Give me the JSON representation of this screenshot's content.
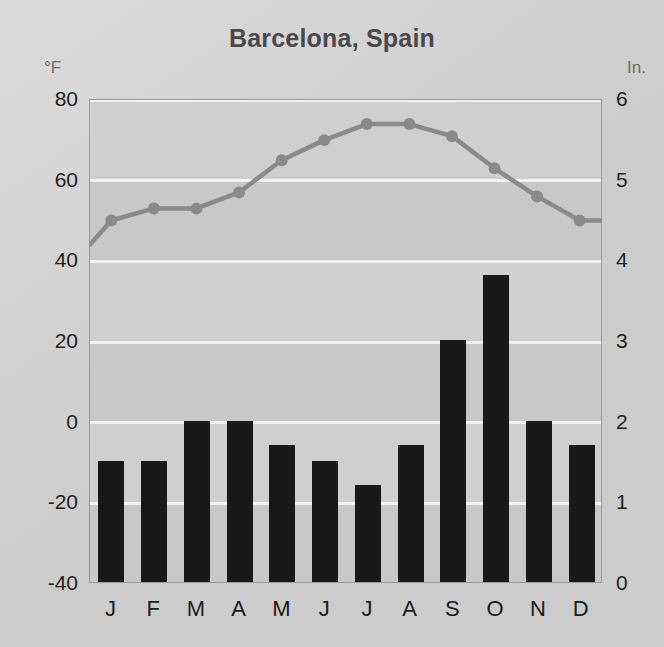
{
  "chart_data": {
    "type": "bar",
    "title": "Barcelona, Spain",
    "xlabel": "",
    "ylabel": "°F",
    "y2label": "In.",
    "categories": [
      "J",
      "F",
      "M",
      "A",
      "M",
      "J",
      "J",
      "A",
      "S",
      "O",
      "N",
      "D"
    ],
    "month_names": [
      "January",
      "February",
      "March",
      "April",
      "May",
      "June",
      "July",
      "August",
      "September",
      "October",
      "November",
      "December"
    ],
    "series": [
      {
        "name": "Precipitation",
        "unit": "In.",
        "render": "bar",
        "color": "#181818",
        "axis": "right",
        "values": [
          1.5,
          1.5,
          2.0,
          2.0,
          1.7,
          1.5,
          1.2,
          1.7,
          3.0,
          3.8,
          2.0,
          1.7
        ]
      },
      {
        "name": "Temperature",
        "unit": "°F",
        "render": "line",
        "color": "#8a8a8a",
        "axis": "left",
        "values": [
          50,
          53,
          53,
          57,
          65,
          70,
          74,
          74,
          71,
          63,
          56,
          50
        ]
      }
    ],
    "yticks_left": [
      80,
      60,
      40,
      20,
      0,
      -20,
      -40
    ],
    "yticks_right": [
      6,
      5,
      4,
      3,
      2,
      1,
      0
    ],
    "ylim": [
      -40,
      80
    ],
    "ylim_right": [
      0,
      6
    ],
    "grid": true,
    "legend": "none",
    "background_color": "#cccccc",
    "plot_background_color": "#c8c8c8",
    "gridline_color": "#f2f2f2"
  },
  "axes": {
    "left_unit": "°F",
    "right_unit": "In."
  }
}
